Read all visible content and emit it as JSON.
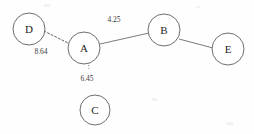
{
  "diagram": {
    "background_color": "#fefefe",
    "node_stroke_color": "#6e6e6e",
    "node_fill_color": "#ffffff",
    "edge_color": "#7a7a7a",
    "label_color": "#242424"
  },
  "nodes": [
    {
      "id": "D",
      "label": "D",
      "cx": 29,
      "cy": 29,
      "r": 16
    },
    {
      "id": "A",
      "label": "A",
      "cx": 84,
      "cy": 48,
      "r": 16
    },
    {
      "id": "B",
      "label": "B",
      "cx": 164,
      "cy": 30,
      "r": 16
    },
    {
      "id": "E",
      "label": "E",
      "cx": 228,
      "cy": 49,
      "r": 16
    },
    {
      "id": "C",
      "label": "C",
      "cx": 95,
      "cy": 110,
      "r": 15
    }
  ],
  "edges": [
    {
      "id": "D-A",
      "source": "D",
      "target": "A",
      "style": "dashed",
      "weight": "8.64",
      "label_x": 41,
      "label_y": 52,
      "x1": 44,
      "y1": 31,
      "x2": 70,
      "y2": 44
    },
    {
      "id": "A-B",
      "source": "A",
      "target": "B",
      "style": "solid",
      "weight": "4.25",
      "label_x": 114,
      "label_y": 20,
      "x1": 100,
      "y1": 44,
      "x2": 149,
      "y2": 33
    },
    {
      "id": "A-C",
      "source": "A",
      "target": "C",
      "style": "stub",
      "weight": "6.45",
      "label_x": 87,
      "label_y": 79,
      "x1": 88,
      "y1": 62,
      "x2": 89,
      "y2": 69
    },
    {
      "id": "B-E",
      "source": "B",
      "target": "E",
      "style": "solid",
      "weight": "",
      "label_x": 0,
      "label_y": 0,
      "x1": 179,
      "y1": 39,
      "x2": 213,
      "y2": 48
    }
  ]
}
